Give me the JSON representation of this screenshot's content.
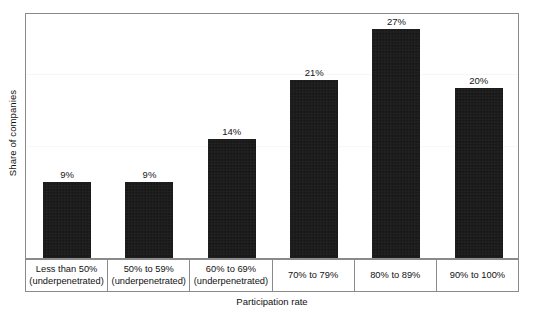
{
  "chart_data": {
    "type": "bar",
    "title": "",
    "xlabel": "Participation rate",
    "ylabel": "Share of companies",
    "categories": [
      "Less than 50% (underpenetrated)",
      "50% to 59% (underpenetrated)",
      "60% to 69% (underpenetrated)",
      "70% to 79%",
      "80% to 89%",
      "90% to 100%"
    ],
    "category_lines": [
      [
        "Less than 50%",
        "(underpenetrated)"
      ],
      [
        "50% to 59%",
        "(underpenetrated)"
      ],
      [
        "60% to 69%",
        "(underpenetrated)"
      ],
      [
        "70% to 79%",
        ""
      ],
      [
        "80% to 89%",
        ""
      ],
      [
        "90% to 100%",
        ""
      ]
    ],
    "values": [
      9,
      9,
      14,
      21,
      27,
      20
    ],
    "value_labels": [
      "9%",
      "9%",
      "14%",
      "21%",
      "27%",
      "20%"
    ],
    "ylim": [
      0,
      29
    ],
    "yticks": [],
    "ytick_labels": [],
    "grid": false,
    "legend": null,
    "bar_color": "#141414",
    "frame_color": "#8a8a8a",
    "units": "percent"
  }
}
